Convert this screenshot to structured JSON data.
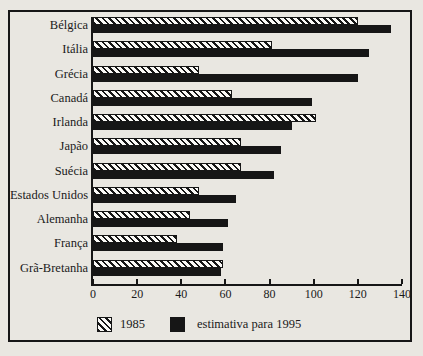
{
  "colors": {
    "background": "#e9e7e1",
    "bar_solid_fill": "#161616",
    "hatch_stroke": "#161616",
    "hatch_background": "#faf9f6",
    "frame_border": "#161616",
    "text": "#1a1a1a"
  },
  "chart_data": {
    "type": "bar",
    "orientation": "horizontal",
    "title": "",
    "xlabel": "",
    "ylabel": "",
    "categories": [
      "Bélgica",
      "Itália",
      "Grécia",
      "Canadá",
      "Irlanda",
      "Japão",
      "Suécia",
      "Estados Unidos",
      "Alemanha",
      "França",
      "Grã-Bretanha"
    ],
    "series": [
      {
        "name": "1985",
        "pattern": "diagonal-hatch",
        "values": [
          120,
          81,
          48,
          63,
          101,
          67,
          67,
          48,
          44,
          38,
          59
        ]
      },
      {
        "name": "estimativa para 1995",
        "pattern": "solid",
        "values": [
          135,
          125,
          120,
          99,
          90,
          85,
          82,
          65,
          61,
          59,
          58
        ]
      }
    ],
    "xlim": [
      0,
      140
    ],
    "x_ticks": [
      0,
      20,
      40,
      60,
      80,
      100,
      120,
      140
    ],
    "grid": false,
    "legend_position": "bottom"
  }
}
